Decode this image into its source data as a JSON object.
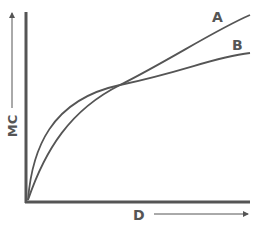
{
  "chart_data": {
    "type": "line",
    "title": "",
    "xlabel": "D",
    "ylabel": "MC",
    "xlim": [
      0,
      1
    ],
    "ylim": [
      0,
      1
    ],
    "grid": false,
    "series": [
      {
        "name": "A",
        "shape": "convex-to-steeper, lower at start, ends highest",
        "x": [
          0,
          0.1,
          0.25,
          0.4,
          0.6,
          0.8,
          1.0
        ],
        "y": [
          0,
          0.33,
          0.55,
          0.62,
          0.73,
          0.84,
          0.95
        ]
      },
      {
        "name": "B",
        "shape": "concave, rises fast then flattens",
        "x": [
          0,
          0.1,
          0.25,
          0.4,
          0.6,
          0.8,
          1.0
        ],
        "y": [
          0,
          0.45,
          0.58,
          0.62,
          0.68,
          0.72,
          0.77
        ]
      }
    ],
    "annotations": [
      "A",
      "B"
    ],
    "colors": {
      "line": "#555555",
      "axis": "#555555"
    }
  }
}
